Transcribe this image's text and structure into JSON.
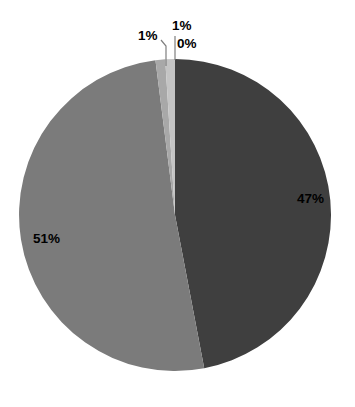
{
  "chart_data": {
    "type": "pie",
    "title": "",
    "subtitle": "",
    "xlabel": "",
    "ylabel": "",
    "grid": false,
    "legend": "none",
    "start_angle_deg": 90,
    "direction": "clockwise",
    "center": {
      "x": 175,
      "y": 215
    },
    "radius": 156,
    "categories": [
      "Series 1",
      "Series 2",
      "Series 3",
      "Series 4",
      "Series 5"
    ],
    "values": [
      47,
      51,
      1,
      1,
      0
    ],
    "data_labels": [
      "47%",
      "51%",
      "1%",
      "1%",
      "0%"
    ],
    "slice_colors": [
      "#3f3f3f",
      "#7b7b7b",
      "#a8a8a8",
      "#c4c4c4",
      "#8f8f8f"
    ],
    "slices": [
      {
        "label": "47%",
        "value": 47,
        "color": "#3f3f3f",
        "label_placement": "inside",
        "label_x": 297,
        "label_y": 192
      },
      {
        "label": "51%",
        "value": 51,
        "color": "#7b7b7b",
        "label_placement": "inside",
        "label_x": 33,
        "label_y": 232
      },
      {
        "label": "1%",
        "value": 1,
        "color": "#a8a8a8",
        "label_placement": "outside",
        "label_x": 138,
        "label_y": 29,
        "leader": "elbow"
      },
      {
        "label": "1%",
        "value": 1,
        "color": "#c4c4c4",
        "label_placement": "outside",
        "label_x": 172,
        "label_y": 19,
        "leader": "vertical"
      },
      {
        "label": "0%",
        "value": 0,
        "color": "#8f8f8f",
        "label_placement": "outside",
        "label_x": 177,
        "label_y": 37,
        "leader": "none"
      }
    ],
    "colors": {
      "background": "#ffffff",
      "label_text": "#000000",
      "leader_line": "#7f7f7f"
    }
  }
}
